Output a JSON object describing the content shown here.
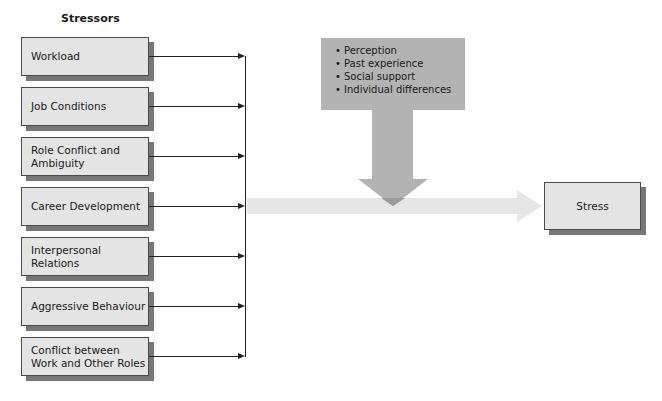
{
  "diagram": {
    "stressors_title": "Stressors",
    "stressors": [
      {
        "label": "Workload"
      },
      {
        "label": "Job Conditions"
      },
      {
        "label": "Role Conflict and Ambiguity"
      },
      {
        "label": "Career Development"
      },
      {
        "label": "Interpersonal Relations"
      },
      {
        "label": "Aggressive Behaviour"
      },
      {
        "label": "Conflict between Work and Other Roles"
      }
    ],
    "moderators": [
      {
        "label": "Perception"
      },
      {
        "label": "Past experience"
      },
      {
        "label": "Social support"
      },
      {
        "label": "Individual differences"
      }
    ],
    "outcome": {
      "label": "Stress"
    },
    "colors": {
      "box_fill": "#e4e4e4",
      "box_shadow": "#777777",
      "moderator_fill": "#b3b3b3",
      "flow_band": "#e6e6e6"
    }
  }
}
